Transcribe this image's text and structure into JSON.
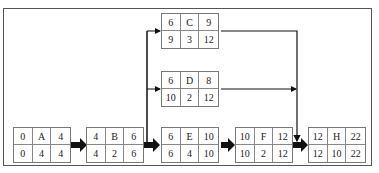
{
  "diagram": {
    "type": "activity-on-node network",
    "nodes": [
      {
        "id": "A",
        "es": "0",
        "dur_top": "4",
        "ls": "0",
        "dur": "4",
        "lf": "4"
      },
      {
        "id": "B",
        "es": "4",
        "dur_top": "6",
        "ls": "4",
        "dur": "2",
        "lf": "6"
      },
      {
        "id": "C",
        "es": "6",
        "dur_top": "9",
        "ls": "9",
        "dur": "3",
        "lf": "12"
      },
      {
        "id": "D",
        "es": "6",
        "dur_top": "8",
        "ls": "10",
        "dur": "2",
        "lf": "12"
      },
      {
        "id": "E",
        "es": "6",
        "dur_top": "10",
        "ls": "6",
        "dur": "4",
        "lf": "10"
      },
      {
        "id": "F",
        "es": "10",
        "dur_top": "12",
        "ls": "10",
        "dur": "2",
        "lf": "12"
      },
      {
        "id": "H",
        "es": "12",
        "dur_top": "22",
        "ls": "12",
        "dur": "10",
        "lf": "22"
      }
    ],
    "edges": [
      {
        "from": "A",
        "to": "B",
        "critical": true
      },
      {
        "from": "B",
        "to": "C",
        "critical": false
      },
      {
        "from": "B",
        "to": "D",
        "critical": false
      },
      {
        "from": "B",
        "to": "E",
        "critical": true
      },
      {
        "from": "E",
        "to": "F",
        "critical": true
      },
      {
        "from": "F",
        "to": "H",
        "critical": true
      },
      {
        "from": "C",
        "to": "H",
        "critical": false
      },
      {
        "from": "D",
        "to": "H",
        "critical": false
      }
    ],
    "colors": {
      "line": "#111111",
      "box_border": "#777777",
      "text": "#222222"
    }
  }
}
